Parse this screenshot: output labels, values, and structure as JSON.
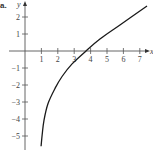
{
  "panel_label": "a.",
  "chart_data": {
    "type": "line",
    "title": "",
    "xlabel": "x",
    "ylabel": "y",
    "xlim": [
      0,
      7.8
    ],
    "ylim": [
      -5.8,
      2.9
    ],
    "grid": false,
    "legend": null,
    "x_ticks": [
      1,
      2,
      3,
      4,
      5,
      6,
      7
    ],
    "y_ticks": [
      2,
      1,
      -1,
      -2,
      -3,
      -4,
      -5
    ],
    "x_tick_labels": [
      "1",
      "2",
      "3",
      "4",
      "5",
      "6",
      "7"
    ],
    "y_tick_labels": [
      "2",
      "1",
      "−1",
      "−2",
      "−3",
      "−4",
      "−5"
    ],
    "series": [
      {
        "name": "curve",
        "color": "#1a1a1a",
        "x": [
          0.98,
          1.05,
          1.16,
          1.4,
          1.83,
          2.26,
          2.87,
          3.72,
          4.57,
          5.79,
          7.44
        ],
        "y": [
          -5.6,
          -4.9,
          -4.06,
          -3.1,
          -2.2,
          -1.5,
          -0.76,
          0.0,
          0.7,
          1.53,
          2.65
        ]
      }
    ]
  }
}
